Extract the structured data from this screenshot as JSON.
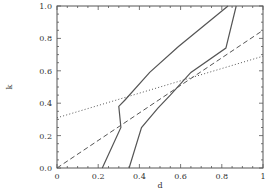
{
  "chart_data": {
    "type": "line",
    "title": "",
    "xlabel": "d",
    "ylabel": "k",
    "xlim": [
      0,
      1
    ],
    "ylim": [
      0,
      1
    ],
    "grid": false,
    "legend": null,
    "x_ticks": [
      "0",
      "0.2",
      "0.4",
      "0.6",
      "0.8",
      "1"
    ],
    "y_ticks": [
      "0.0",
      "0.2",
      "0.4",
      "0.6",
      "0.8",
      "1.0"
    ],
    "series": [
      {
        "name": "solid-left",
        "style": "solid",
        "color": "#555555",
        "points": [
          [
            0.22,
            0.0
          ],
          [
            0.31,
            0.25
          ],
          [
            0.3,
            0.38
          ],
          [
            0.33,
            0.42
          ],
          [
            0.45,
            0.59
          ],
          [
            0.59,
            0.75
          ],
          [
            0.83,
            1.0
          ]
        ]
      },
      {
        "name": "solid-right",
        "style": "solid",
        "color": "#555555",
        "points": [
          [
            0.35,
            0.0
          ],
          [
            0.41,
            0.25
          ],
          [
            0.49,
            0.37
          ],
          [
            0.55,
            0.45
          ],
          [
            0.65,
            0.59
          ],
          [
            0.82,
            0.74
          ],
          [
            0.87,
            1.0
          ]
        ]
      },
      {
        "name": "dashed",
        "style": "dashed",
        "color": "#555555",
        "points": [
          [
            0.0,
            0.0
          ],
          [
            1.0,
            0.85
          ]
        ]
      },
      {
        "name": "dotted",
        "style": "dotted",
        "color": "#555555",
        "points": [
          [
            0.0,
            0.31
          ],
          [
            1.0,
            0.69
          ]
        ]
      }
    ]
  }
}
